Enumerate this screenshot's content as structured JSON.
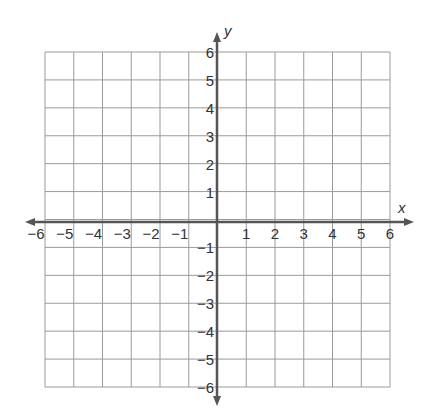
{
  "graph": {
    "x_axis_label": "x",
    "y_axis_label": "y",
    "x_min": -6,
    "x_max": 6,
    "y_min": -6,
    "y_max": 6,
    "x_ticks": [
      "−6",
      "−5",
      "−4",
      "−3",
      "−2",
      "−1",
      "1",
      "2",
      "3",
      "4",
      "5",
      "6"
    ],
    "y_ticks": [
      "6",
      "5",
      "4",
      "3",
      "2",
      "1",
      "−1",
      "−2",
      "−3",
      "−4",
      "−5",
      "−6"
    ],
    "grid_color": "#9a9a9a",
    "axis_color": "#555555"
  }
}
